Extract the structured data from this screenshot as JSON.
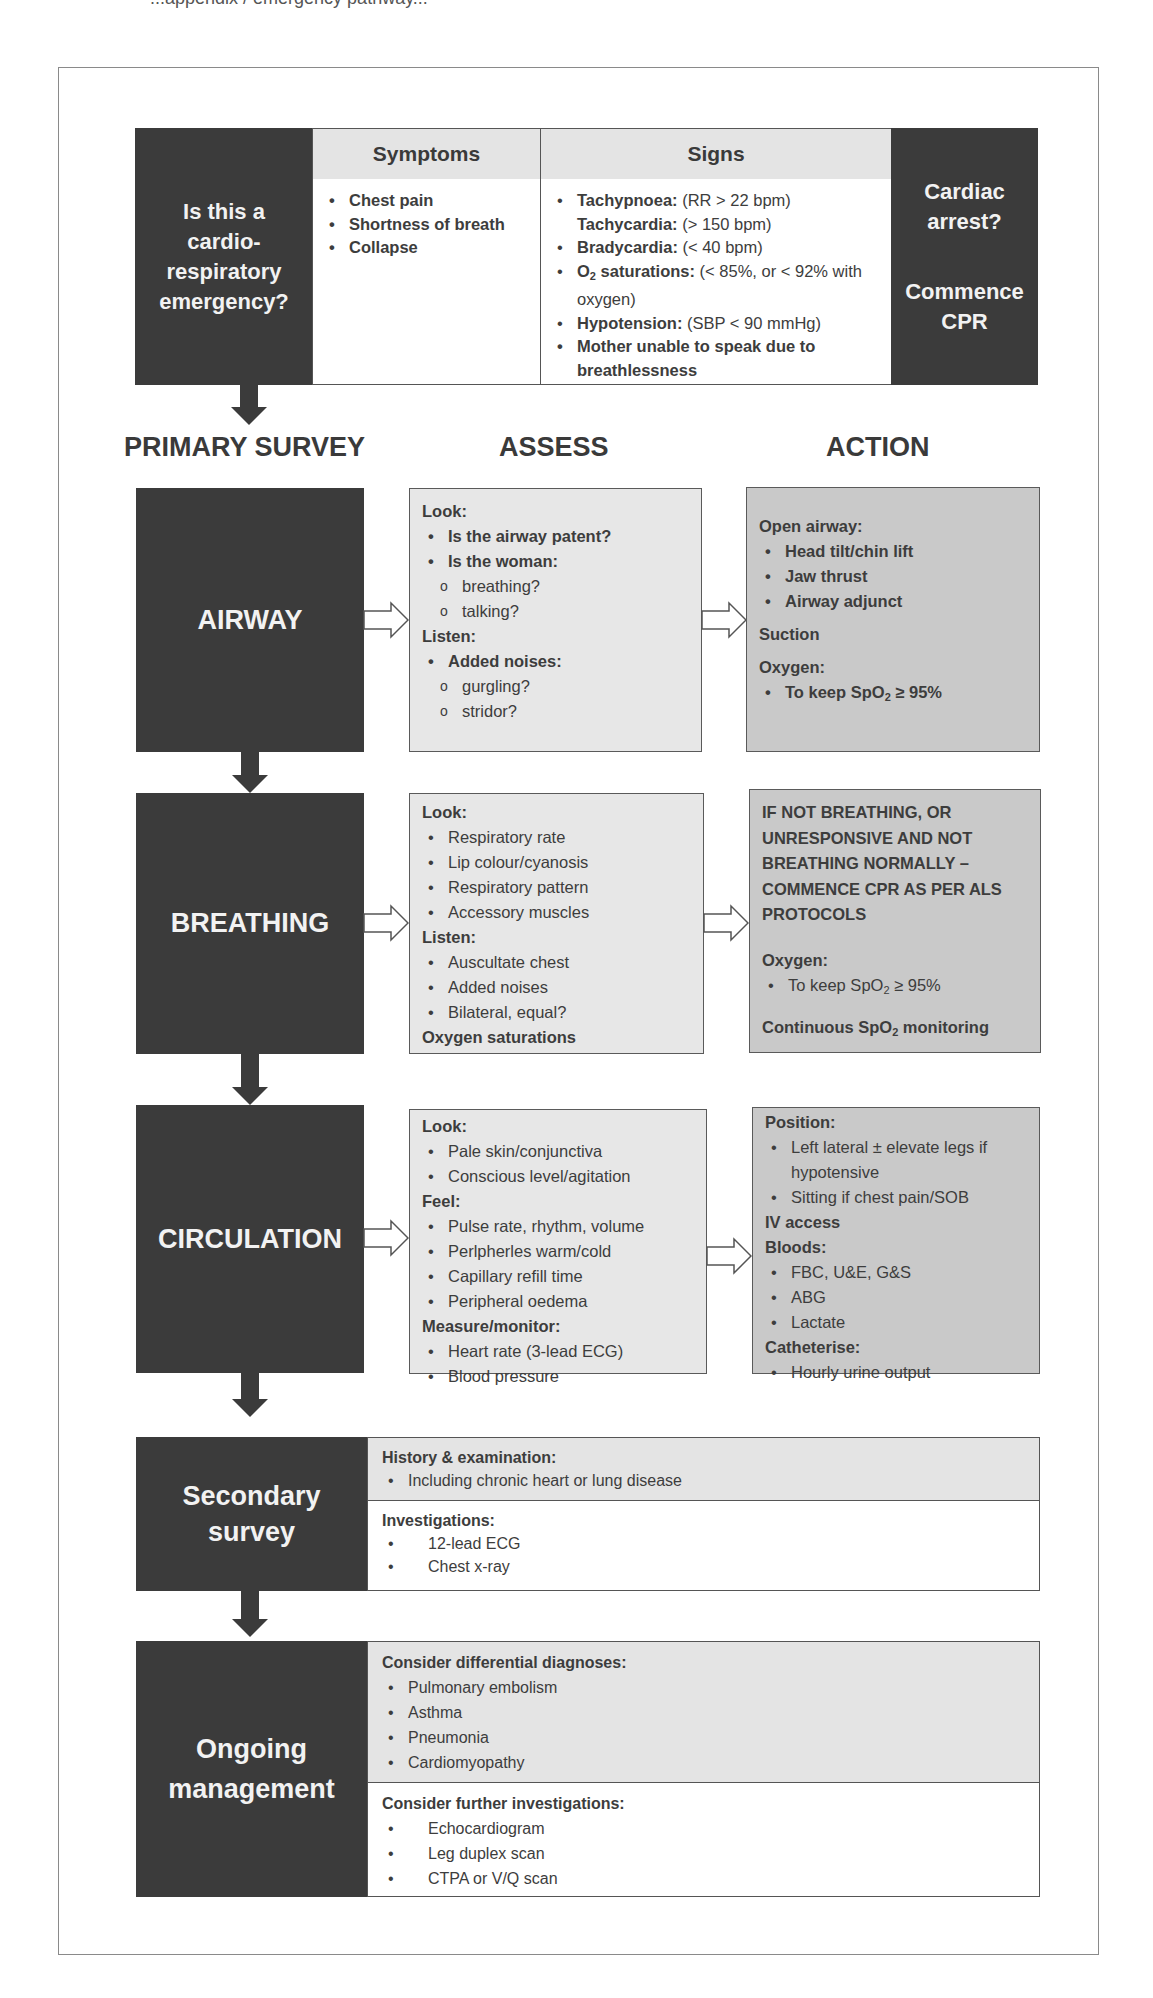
{
  "cut_text": "...appendix / emergency pathway...",
  "triage": {
    "question": "Is this a cardio-respiratory emergency?",
    "question_lines": [
      "Is this a",
      "cardio-",
      "respiratory",
      "emergency?"
    ],
    "symptoms_header": "Symptoms",
    "symptoms": [
      "Chest pain",
      "Shortness of breath",
      "Collapse"
    ],
    "signs_header": "Signs",
    "signs": [
      {
        "label": "Tachypnoea:",
        "detail": " (RR > 22 bpm)"
      },
      {
        "label": "Tachycardia:",
        "detail": " (> 150 bpm)"
      },
      {
        "label": "Bradycardia:",
        "detail": " (< 40 bpm)"
      },
      {
        "label_pre": "O",
        "label_sub": "2",
        "label_post": " saturations:",
        "detail": " (< 85%, or < 92% with oxygen)"
      },
      {
        "label": "Hypotension:",
        "detail": " (SBP < 90 mmHg)"
      },
      {
        "label": "Mother unable to speak due to breathlessness",
        "detail": ""
      }
    ],
    "arrest_q": [
      "Cardiac",
      "arrest?"
    ],
    "arrest_action": [
      "Commence",
      "CPR"
    ]
  },
  "columns": {
    "primary": "PRIMARY SURVEY",
    "assess": "ASSESS",
    "action": "ACTION"
  },
  "airway": {
    "label": "AIRWAY",
    "assess": {
      "look": "Look:",
      "q1": "Is the airway patent?",
      "q2": "Is the woman:",
      "q2a": "breathing?",
      "q2b": "talking?",
      "listen": "Listen:",
      "q3": "Added noises:",
      "q3a": "gurgling?",
      "q3b": "stridor?"
    },
    "action": {
      "open": "Open airway:",
      "items": [
        "Head tilt/chin lift",
        "Jaw thrust",
        "Airway adjunct"
      ],
      "suction": "Suction",
      "oxygen": "Oxygen:",
      "oxygen_item_pre": "To keep SpO",
      "oxygen_item_sub": "2",
      "oxygen_item_post": " ≥ 95%"
    }
  },
  "breathing": {
    "label": "BREATHING",
    "assess": {
      "look": "Look:",
      "look_items": [
        "Respiratory rate",
        "Lip colour/cyanosis",
        "Respiratory pattern",
        "Accessory muscles"
      ],
      "listen": "Listen:",
      "listen_items": [
        "Auscultate chest",
        "Added noises",
        "Bilateral, equal?"
      ],
      "sats": "Oxygen saturations"
    },
    "action": {
      "warning": "IF NOT  BREATHING, OR UNRESPONSIVE AND NOT BREATHING NORMALLY – COMMENCE CPR AS PER ALS PROTOCOLS",
      "oxygen": "Oxygen:",
      "oxygen_item_pre": "To keep SpO",
      "oxygen_item_sub": "2",
      "oxygen_item_post": " ≥ 95%",
      "monitor_pre": "Continuous SpO",
      "monitor_sub": "2",
      "monitor_post": " monitoring"
    }
  },
  "circulation": {
    "label": "CIRCULATION",
    "assess": {
      "look": "Look:",
      "look_items": [
        "Pale skin/conjunctiva",
        "Conscious level/agitation"
      ],
      "feel": "Feel:",
      "feel_items": [
        "Pulse rate, rhythm, volume",
        "Perlpherles warm/cold",
        "Capillary refill time",
        "Peripheral oedema"
      ],
      "measure": "Measure/monitor:",
      "measure_items": [
        "Heart rate (3-lead ECG)",
        "Blood pressure"
      ]
    },
    "action": {
      "position": "Position:",
      "position_items": [
        "Left lateral ± elevate legs if hypotensive",
        "Sitting if chest pain/SOB"
      ],
      "iv": "IV access",
      "bloods": "Bloods:",
      "bloods_items": [
        "FBC, U&E, G&S",
        "ABG",
        "Lactate"
      ],
      "catheterise": "Catheterise:",
      "catheterise_items": [
        "Hourly urine output"
      ]
    }
  },
  "secondary": {
    "label_lines": [
      "Secondary",
      "survey"
    ],
    "history": "History & examination:",
    "history_items": [
      "Including chronic heart or lung disease"
    ],
    "investigations": "Investigations:",
    "investigation_items": [
      "12-lead ECG",
      "Chest x-ray"
    ]
  },
  "ongoing": {
    "label_lines": [
      "Ongoing",
      "management"
    ],
    "differentials": "Consider differential diagnoses:",
    "differential_items": [
      "Pulmonary embolism",
      "Asthma",
      "Pneumonia",
      "Cardiomyopathy"
    ],
    "further": "Consider further investigations:",
    "further_items": [
      "Echocardiogram",
      "Leg duplex scan",
      "CTPA or V/Q scan"
    ]
  },
  "colors": {
    "dark_box": "#3b3b3b",
    "assess_box": "#e7e7e7",
    "action_box": "#c9c9c9",
    "header_fill": "#e4e4e4",
    "text": "#3d3d3d"
  }
}
